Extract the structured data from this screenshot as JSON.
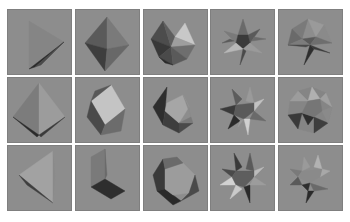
{
  "figure": {
    "layout": {
      "columns": 5,
      "rows": 3
    },
    "background": "#ffffff",
    "tile_color": "#8d8d8d",
    "tile_border": "#7f7f7f",
    "col_x": [
      7,
      75,
      143,
      210,
      278
    ],
    "row_y": [
      9,
      77,
      145
    ],
    "tiles": [
      {
        "row": 0,
        "col": 0,
        "shape": "tetrahedron-edge-view",
        "polys": [
          {
            "pts": "22,12 57,33 22,60",
            "fill": "#858585"
          },
          {
            "pts": "57,33 22,60 28,58",
            "fill": "#2a2a2a"
          },
          {
            "pts": "57,33 28,58 34,56",
            "fill": "#4a4a4a"
          }
        ]
      },
      {
        "row": 0,
        "col": 1,
        "shape": "octahedron",
        "polys": [
          {
            "pts": "32,8 10,34 32,40",
            "fill": "#5a5a5a"
          },
          {
            "pts": "32,8 32,40 54,36",
            "fill": "#7a7a7a"
          },
          {
            "pts": "10,34 32,40 30,62",
            "fill": "#3e3e3e"
          },
          {
            "pts": "32,40 54,36 30,62",
            "fill": "#686868"
          }
        ]
      },
      {
        "row": 0,
        "col": 2,
        "shape": "icosahedron",
        "polys": [
          {
            "pts": "20,12 8,30 28,38",
            "fill": "#4c4c4c"
          },
          {
            "pts": "20,12 28,38 32,28",
            "fill": "#5e5e5e"
          },
          {
            "pts": "32,28 42,14 52,36",
            "fill": "#c8c8c8"
          },
          {
            "pts": "32,28 28,38 52,36",
            "fill": "#9e9e9e"
          },
          {
            "pts": "8,30 28,38 16,48",
            "fill": "#383838"
          },
          {
            "pts": "28,38 52,36 44,50",
            "fill": "#6e6e6e"
          },
          {
            "pts": "16,48 28,38 30,56",
            "fill": "#4a4a4a"
          },
          {
            "pts": "28,38 44,50 30,56",
            "fill": "#5a5a5a"
          },
          {
            "pts": "16,48 30,56 22,54",
            "fill": "#2a2a2a"
          }
        ]
      },
      {
        "row": 0,
        "col": 3,
        "shape": "small-stellated-dodecahedron",
        "polys": [
          {
            "pts": "33,10 28,26 38,26",
            "fill": "#6a6a6a"
          },
          {
            "pts": "14,22 28,26 26,34",
            "fill": "#7a7a7a"
          },
          {
            "pts": "50,20 38,26 40,34",
            "fill": "#5a5a5a"
          },
          {
            "pts": "28,26 38,26 40,34 33,40 26,34",
            "fill": "#3a3a3a"
          },
          {
            "pts": "26,34 14,44 33,40",
            "fill": "#b8b8b8"
          },
          {
            "pts": "40,34 52,44 33,40",
            "fill": "#9a9a9a"
          },
          {
            "pts": "33,40 30,56 36,42",
            "fill": "#4a4a4a"
          },
          {
            "pts": "20,30 12,34 24,32",
            "fill": "#5a5a5a"
          },
          {
            "pts": "44,28 56,30 42,32",
            "fill": "#6a6a6a"
          }
        ]
      },
      {
        "row": 0,
        "col": 4,
        "shape": "great-dodecahedron",
        "polys": [
          {
            "pts": "30,10 14,20 24,30",
            "fill": "#7a7a7a"
          },
          {
            "pts": "30,10 46,16 38,28",
            "fill": "#9a9a9a"
          },
          {
            "pts": "14,20 10,36 24,30",
            "fill": "#6a6a6a"
          },
          {
            "pts": "46,16 54,34 38,28",
            "fill": "#8a8a8a"
          },
          {
            "pts": "24,30 38,28 32,36",
            "fill": "#5a5a5a"
          },
          {
            "pts": "10,36 24,30 32,36",
            "fill": "#7c7c7c"
          },
          {
            "pts": "54,34 38,28 32,36",
            "fill": "#6e6e6e"
          },
          {
            "pts": "32,36 26,56 36,40",
            "fill": "#2e2e2e"
          },
          {
            "pts": "32,36 52,44 36,40",
            "fill": "#3a3a3a"
          },
          {
            "pts": "10,36 28,38 32,36",
            "fill": "#4a4a4a"
          }
        ]
      },
      {
        "row": 1,
        "col": 0,
        "shape": "octahedron-top-lit",
        "polys": [
          {
            "pts": "32,6 6,40 32,58",
            "fill": "#7c7c7c"
          },
          {
            "pts": "32,6 32,58 58,40",
            "fill": "#9c9c9c"
          },
          {
            "pts": "6,40 32,58 30,60",
            "fill": "#2a2a2a"
          },
          {
            "pts": "32,58 58,40 34,60",
            "fill": "#3a3a3a"
          }
        ]
      },
      {
        "row": 1,
        "col": 1,
        "shape": "cube",
        "polys": [
          {
            "pts": "36,8 16,24 30,48 50,32",
            "fill": "#c4c4c4"
          },
          {
            "pts": "16,24 12,40 26,58 30,48",
            "fill": "#4a4a4a"
          },
          {
            "pts": "30,48 26,58 46,54 50,32",
            "fill": "#6c6c6c"
          },
          {
            "pts": "36,8 16,24 20,14",
            "fill": "#585858"
          }
        ]
      },
      {
        "row": 1,
        "col": 2,
        "shape": "icosahedron-crescent",
        "polys": [
          {
            "pts": "24,10 10,30 20,48 22,34",
            "fill": "#2e2e2e"
          },
          {
            "pts": "22,34 20,48 36,56 36,46",
            "fill": "#3e3e3e"
          },
          {
            "pts": "36,46 36,56 50,46",
            "fill": "#4a4a4a"
          },
          {
            "pts": "24,26 40,18 46,30 36,46 22,34",
            "fill": "#a6a6a6"
          },
          {
            "pts": "40,18 46,30 48,40",
            "fill": "#8c8c8c"
          },
          {
            "pts": "36,46 48,40 50,46",
            "fill": "#7a7a7a"
          }
        ]
      },
      {
        "row": 1,
        "col": 3,
        "shape": "great-stellated-dodecahedron",
        "polys": [
          {
            "pts": "22,12 26,28 32,22",
            "fill": "#5c5c5c"
          },
          {
            "pts": "40,10 36,24 44,26",
            "fill": "#9a9a9a"
          },
          {
            "pts": "54,22 44,26 44,34",
            "fill": "#c2c2c2"
          },
          {
            "pts": "10,32 26,28 24,38",
            "fill": "#3a3a3a"
          },
          {
            "pts": "26,28 44,26 44,34 34,42 24,38",
            "fill": "#5a5a5a"
          },
          {
            "pts": "24,38 18,52 30,44",
            "fill": "#2a2a2a"
          },
          {
            "pts": "34,42 38,58 40,42",
            "fill": "#d0d0d0"
          },
          {
            "pts": "44,34 56,44 40,42",
            "fill": "#6a6a6a"
          },
          {
            "pts": "30,44 34,42 28,50",
            "fill": "#9a9a9a"
          }
        ]
      },
      {
        "row": 1,
        "col": 4,
        "shape": "great-icosahedron",
        "polys": [
          {
            "pts": "20,14 34,10 48,16 54,30 50,46 36,56 20,52 10,38 12,24",
            "fill": "#858585"
          },
          {
            "pts": "20,14 30,24 12,24",
            "fill": "#9c9c9c"
          },
          {
            "pts": "34,10 30,24 42,22",
            "fill": "#b0b0b0"
          },
          {
            "pts": "48,16 42,22 54,30",
            "fill": "#a0a0a0"
          },
          {
            "pts": "10,38 24,36 20,52",
            "fill": "#3a3a3a"
          },
          {
            "pts": "24,36 36,40 30,48",
            "fill": "#2e2e2e"
          },
          {
            "pts": "36,40 50,46 36,56",
            "fill": "#3e3e3e"
          },
          {
            "pts": "30,24 42,22 44,34 36,40 24,36",
            "fill": "#767676"
          },
          {
            "pts": "44,34 54,30 50,46",
            "fill": "#8a8a8a"
          }
        ]
      },
      {
        "row": 2,
        "col": 0,
        "shape": "tetrahedron",
        "polys": [
          {
            "pts": "46,6 12,30 46,58",
            "fill": "#a2a2a2"
          },
          {
            "pts": "12,30 46,58 20,40",
            "fill": "#3e3e3e"
          },
          {
            "pts": "46,6 46,58 48,30",
            "fill": "#8a8a8a"
          }
        ]
      },
      {
        "row": 2,
        "col": 1,
        "shape": "cube-corner",
        "polys": [
          {
            "pts": "16,12 30,4 30,34 16,42",
            "fill": "#7a7a7a"
          },
          {
            "pts": "16,42 30,34 50,46 36,54",
            "fill": "#2e2e2e"
          },
          {
            "pts": "30,4 30,34 32,30",
            "fill": "#6a6a6a"
          }
        ]
      },
      {
        "row": 2,
        "col": 2,
        "shape": "dodecahedron",
        "polys": [
          {
            "pts": "20,14 10,30 14,46 22,44 22,24",
            "fill": "#3a3a3a"
          },
          {
            "pts": "14,46 22,44 38,56 30,60",
            "fill": "#2a2a2a"
          },
          {
            "pts": "22,24 40,18 52,30 46,48 30,50 22,44",
            "fill": "#9c9c9c"
          },
          {
            "pts": "38,56 46,48 52,30 56,46",
            "fill": "#4a4a4a"
          },
          {
            "pts": "20,14 22,24 40,18 34,12",
            "fill": "#6a6a6a"
          }
        ]
      },
      {
        "row": 2,
        "col": 3,
        "shape": "great-stellated-dodecahedron-alt",
        "polys": [
          {
            "pts": "24,8 26,26 32,22",
            "fill": "#3a3a3a"
          },
          {
            "pts": "40,8 36,24 44,26",
            "fill": "#5a5a5a"
          },
          {
            "pts": "12,24 26,26 22,32",
            "fill": "#4a4a4a"
          },
          {
            "pts": "54,22 44,26 44,32",
            "fill": "#bcbcbc"
          },
          {
            "pts": "10,40 22,32 26,40",
            "fill": "#d2d2d2"
          },
          {
            "pts": "26,26 44,26 44,32 34,42 26,40 22,32",
            "fill": "#5e5e5e"
          },
          {
            "pts": "26,40 20,54 32,44",
            "fill": "#cacaca"
          },
          {
            "pts": "34,42 40,58 40,40",
            "fill": "#2a2a2a"
          },
          {
            "pts": "44,32 56,40 40,40",
            "fill": "#9c9c9c"
          }
        ]
      },
      {
        "row": 2,
        "col": 4,
        "shape": "small-stellated-dodecahedron-alt",
        "polys": [
          {
            "pts": "26,12 24,26 32,22",
            "fill": "#9a9a9a"
          },
          {
            "pts": "40,10 36,22 44,24",
            "fill": "#b2b2b2"
          },
          {
            "pts": "12,24 24,26 20,32",
            "fill": "#7a7a7a"
          },
          {
            "pts": "52,26 44,24 42,32",
            "fill": "#a8a8a8"
          },
          {
            "pts": "24,26 44,24 42,32 32,38 20,32",
            "fill": "#8a8a8a"
          },
          {
            "pts": "12,40 20,32 24,40",
            "fill": "#5a5a5a"
          },
          {
            "pts": "24,40 32,38 30,46",
            "fill": "#2e2e2e"
          },
          {
            "pts": "30,46 28,58 36,46",
            "fill": "#2a2a2a"
          },
          {
            "pts": "32,38 50,44 36,46",
            "fill": "#6a6a6a"
          }
        ]
      }
    ]
  }
}
